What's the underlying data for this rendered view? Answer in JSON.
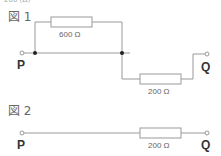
{
  "top_cut_text": "200 (Ω)",
  "figure1": {
    "label": "図 1",
    "terminal_left": "P",
    "terminal_right": "Q",
    "resistor_top": "600 Ω",
    "resistor_bottom": "200 Ω"
  },
  "figure2": {
    "label": "図 2",
    "terminal_left": "P",
    "terminal_right": "Q",
    "resistor": "200 Ω"
  },
  "colors": {
    "wire": "#999999",
    "node": "#222222"
  }
}
